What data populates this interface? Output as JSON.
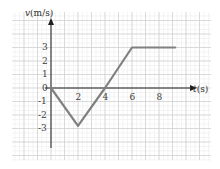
{
  "figure": {
    "background_color": "#ffffff",
    "border_color": "#e6e6e6"
  },
  "chart_data": {
    "type": "line",
    "title": "",
    "subtitle": "",
    "xlabel": "t(s)",
    "ylabel": "v(m/s)",
    "xlabel_symbol": "t",
    "xlabel_unit": "(s)",
    "ylabel_symbol": "v",
    "ylabel_unit": "(m/s)",
    "xlim": [
      -0.6,
      9.8
    ],
    "ylim": [
      -4.0,
      4.1
    ],
    "xticks": [
      2,
      4,
      6,
      8
    ],
    "xtick_labels": [
      "2",
      "4",
      "6",
      "8"
    ],
    "yticks": [
      3,
      2,
      1,
      0,
      -1,
      -2,
      -3
    ],
    "ytick_labels": [
      "3",
      "2",
      "1",
      "0",
      "-1",
      "-2",
      "-3"
    ],
    "grid": true,
    "grid_major_color": "#cfcfcf",
    "grid_minor_color": "#ececec",
    "grid_major_step_x": 1,
    "grid_major_step_y": 1,
    "grid_minor_per_major": 3,
    "legend": false,
    "legend_position": "none",
    "axis_color": "#1f1f1f",
    "series": [
      {
        "name": "velocity",
        "color": "#808080",
        "line_width": 2.2,
        "x": [
          0,
          2,
          4,
          6,
          8,
          9.2
        ],
        "y": [
          0,
          -2.8,
          0,
          3,
          3,
          3
        ]
      }
    ],
    "annotations": [],
    "key_points": [
      {
        "t": 0,
        "v": 0
      },
      {
        "t": 2,
        "v": -2.8
      },
      {
        "t": 4,
        "v": 0
      },
      {
        "t": 6,
        "v": 3
      },
      {
        "t": 8,
        "v": 3
      }
    ]
  }
}
